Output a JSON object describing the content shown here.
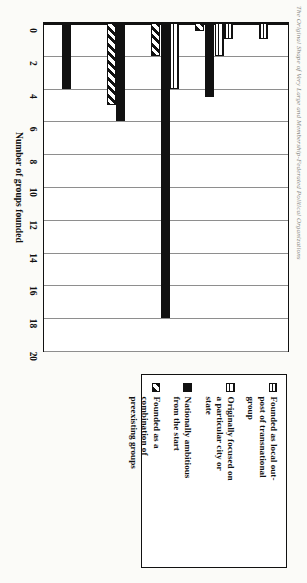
{
  "caption": {
    "text": "The Original Shape of Very Large and Membership-Federated Political Organizations"
  },
  "chart_data": {
    "type": "bar",
    "orientation": "vertical",
    "title": "",
    "xlabel": "",
    "ylabel": "Number of groups founded",
    "ylim": [
      0,
      20
    ],
    "ytick_step": 2,
    "yticks": [
      "0",
      "2",
      "4",
      "6",
      "8",
      "10",
      "12",
      "14",
      "16",
      "18",
      "20"
    ],
    "grid": "y-gridlines only",
    "legend_position": "right",
    "categories": [
      "Colonial (pre-1790)",
      "Early National (1819–59)",
      "Post–Civil War era (1860–99)",
      "Early Twentieth Century (1900–1940)",
      "Post–World War II (after 1945)"
    ],
    "category_lines": [
      [
        "Colonial",
        "(pre-1790)"
      ],
      [
        "Early",
        "National",
        "(1819–59)"
      ],
      [
        "Post–Civil",
        "War era",
        "(1860–99)"
      ],
      [
        "Early",
        "Twentieth",
        "Century",
        "(1900–1940)"
      ],
      [
        "Post–World",
        "War II (after",
        "1945)"
      ]
    ],
    "series": [
      {
        "name": "Founded as local outpost of transnational group",
        "pattern": "horizontal-lines",
        "values": [
          1,
          1,
          0,
          0,
          0
        ]
      },
      {
        "name": "Originally focused on a particular city or state",
        "pattern": "checkered-dots",
        "values": [
          0,
          2,
          4,
          0,
          0
        ]
      },
      {
        "name": "Nationally ambitious from the start",
        "pattern": "solid-black",
        "values": [
          0,
          4.5,
          18,
          6,
          4
        ]
      },
      {
        "name": "Founded as a combination of preexisting groups",
        "pattern": "diagonal-hatch",
        "values": [
          0,
          0.5,
          2,
          5,
          0
        ]
      }
    ]
  },
  "legend": {
    "items": [
      {
        "swatch": "horizontal-lines-swatch",
        "lines": [
          "Founded as local out-",
          "post of transnational",
          "group"
        ]
      },
      {
        "swatch": "checkered-dots-swatch",
        "lines": [
          "Originally focused on",
          "a particular city or",
          "state"
        ]
      },
      {
        "swatch": "solid-black-swatch",
        "lines": [
          "Nationally ambitious",
          "from the start"
        ]
      },
      {
        "swatch": "diagonal-hatch-swatch",
        "lines": [
          "Founded as a",
          "combination of",
          "preexisting groups"
        ]
      }
    ]
  },
  "colors": {
    "ink": "#111111",
    "grid": "#8e8e8e",
    "paper": "#fbfbf8"
  }
}
